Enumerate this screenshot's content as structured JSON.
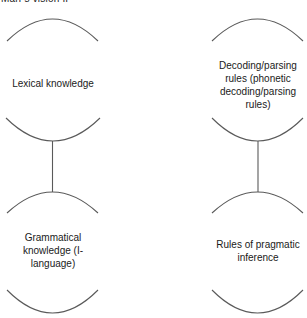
{
  "header": {
    "title": "Marr's vision II"
  },
  "colors": {
    "stroke": "#5a5a5a",
    "text": "#1a1a1a",
    "background": "#ffffff"
  },
  "nodes": [
    {
      "id": "lexical",
      "label": "Lexical knowledge",
      "column": "left",
      "row": "top"
    },
    {
      "id": "decoding",
      "label": "Decoding/parsing rules (phonetic decoding/parsing rules)",
      "column": "right",
      "row": "top"
    },
    {
      "id": "grammatical",
      "label": "Grammatical knowledge (I-language)",
      "column": "left",
      "row": "bottom"
    },
    {
      "id": "pragmatic",
      "label": "Rules of pragmatic inference",
      "column": "right",
      "row": "bottom"
    }
  ],
  "edges": [
    {
      "from": "lexical",
      "to": "grammatical"
    },
    {
      "from": "decoding",
      "to": "pragmatic"
    }
  ]
}
